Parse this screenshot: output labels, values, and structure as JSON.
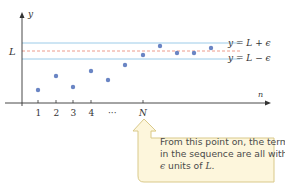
{
  "diagram": {
    "axes": {
      "x_label": "n",
      "y_label": "y",
      "y_tick_label": "L",
      "x_tick_labels": [
        "1",
        "2",
        "3",
        "4",
        "···",
        "N"
      ]
    },
    "bands": {
      "upper_label": "y = L + ϵ",
      "lower_label": "y = L − ϵ"
    },
    "points": [
      {
        "n": 1,
        "x": 38,
        "y": 90
      },
      {
        "n": 2,
        "x": 56,
        "y": 76
      },
      {
        "n": 3,
        "x": 73,
        "y": 87
      },
      {
        "n": 4,
        "x": 91,
        "y": 71
      },
      {
        "n": 5,
        "x": 108,
        "y": 80
      },
      {
        "n": 6,
        "x": 125,
        "y": 65
      },
      {
        "n": 7,
        "x": 143,
        "y": 55
      },
      {
        "n": 8,
        "x": 160,
        "y": 46
      },
      {
        "n": 9,
        "x": 177,
        "y": 53
      },
      {
        "n": 10,
        "x": 194,
        "y": 53
      },
      {
        "n": 11,
        "x": 211,
        "y": 48
      }
    ],
    "callout": {
      "line1": "From this point on, the terms",
      "line2": "in the sequence are all within",
      "line3_eps": "ϵ",
      "line3_rest": " units of ",
      "line3_L": "L",
      "line3_end": "."
    },
    "colors": {
      "band_line": "#9ccbe8",
      "limit_line": "#e8836f",
      "point": "#6a85c4",
      "axis": "#333333",
      "callout_fill": "#fdf6dc",
      "callout_stroke": "#d9c98a"
    }
  }
}
